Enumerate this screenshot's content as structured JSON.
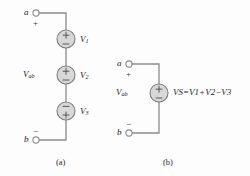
{
  "figure": {
    "type": "circuit-diagram",
    "colors": {
      "wire": "#8c8c8c",
      "source_fill": "#d8d8d8",
      "source_stroke": "#7d7d7d",
      "text": "#1d1d1d",
      "background": "#fdfdfd"
    }
  },
  "panel_a": {
    "caption": "(a)",
    "terminal_top": {
      "label": "a",
      "polarity": "+"
    },
    "terminal_bottom": {
      "label": "b",
      "polarity": "−"
    },
    "port_voltage": {
      "symbol": "V",
      "subscript": "ab"
    },
    "sources": [
      {
        "symbol": "V",
        "subscript": "1",
        "top_sign": "+",
        "bottom_sign": "−"
      },
      {
        "symbol": "V",
        "subscript": "2",
        "top_sign": "+",
        "bottom_sign": "−"
      },
      {
        "symbol": "V",
        "subscript": "3",
        "top_sign": "−",
        "bottom_sign": "+"
      }
    ]
  },
  "panel_b": {
    "caption": "(b)",
    "terminal_top": {
      "label": "a",
      "polarity": "+"
    },
    "terminal_bottom": {
      "label": "b",
      "polarity": "−"
    },
    "port_voltage": {
      "symbol": "V",
      "subscript": "ab"
    },
    "source": {
      "symbol": "V",
      "subscript": "S",
      "top_sign": "+",
      "bottom_sign": "−"
    },
    "equation": {
      "lhs_symbol": "V",
      "lhs_subscript": "S",
      "equals": "=",
      "terms": [
        {
          "operator": "",
          "symbol": "V",
          "subscript": "1"
        },
        {
          "operator": "+",
          "symbol": "V",
          "subscript": "2"
        },
        {
          "operator": "−",
          "symbol": "V",
          "subscript": "3"
        }
      ]
    }
  }
}
